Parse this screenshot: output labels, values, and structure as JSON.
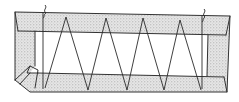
{
  "figure": {
    "labels": [],
    "zigzag": {
      "peaks": 4,
      "valleys": 5
    },
    "colors": {
      "line": "#333333",
      "shading": "#c8c8c8",
      "background": "#ffffff"
    }
  }
}
